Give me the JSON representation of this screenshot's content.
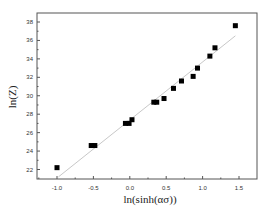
{
  "chart_data": {
    "type": "scatter",
    "title": "",
    "xlabel": "ln(sinh(ασ))",
    "ylabel": "ln(Z)",
    "xlim": [
      -1.3,
      1.75
    ],
    "ylim": [
      21,
      39
    ],
    "xticks": [
      -1.0,
      -0.5,
      0.0,
      0.5,
      1.0,
      1.5
    ],
    "xtick_labels": [
      "-1.0",
      "-0.5",
      "0.0",
      "0.5",
      "1.0",
      "1.5"
    ],
    "yticks": [
      22,
      24,
      26,
      28,
      30,
      32,
      34,
      36,
      38
    ],
    "ytick_labels": [
      "22",
      "24",
      "26",
      "28",
      "30",
      "32",
      "34",
      "36",
      "38"
    ],
    "grid": false,
    "legend": null,
    "series": [
      {
        "name": "data",
        "marker": "square",
        "color": "#000000",
        "points": [
          {
            "x": -1.0,
            "y": 22.2
          },
          {
            "x": -0.53,
            "y": 24.6
          },
          {
            "x": -0.48,
            "y": 24.6
          },
          {
            "x": -0.06,
            "y": 27.0
          },
          {
            "x": -0.01,
            "y": 27.0
          },
          {
            "x": 0.03,
            "y": 27.4
          },
          {
            "x": 0.33,
            "y": 29.3
          },
          {
            "x": 0.37,
            "y": 29.3
          },
          {
            "x": 0.47,
            "y": 29.7
          },
          {
            "x": 0.6,
            "y": 30.8
          },
          {
            "x": 0.71,
            "y": 31.6
          },
          {
            "x": 0.87,
            "y": 32.1
          },
          {
            "x": 0.93,
            "y": 33.0
          },
          {
            "x": 1.1,
            "y": 34.3
          },
          {
            "x": 1.17,
            "y": 35.2
          },
          {
            "x": 1.45,
            "y": 37.6
          }
        ]
      },
      {
        "name": "linear fit",
        "type": "line",
        "color": "#c8c8c8",
        "points": [
          {
            "x": -0.98,
            "y": 21.2
          },
          {
            "x": 1.45,
            "y": 36.5
          }
        ]
      }
    ]
  }
}
